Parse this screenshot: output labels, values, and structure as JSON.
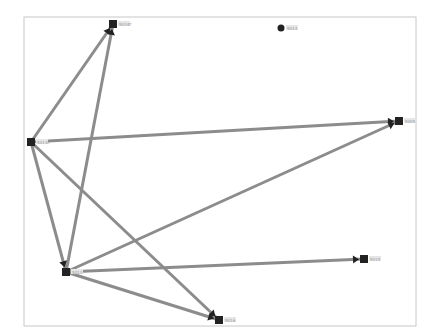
{
  "diagram": {
    "type": "network-graph",
    "frame": {
      "x": 24,
      "y": 17,
      "w": 392,
      "h": 309,
      "color": "#c8c8c8"
    },
    "colors": {
      "edge": "#8c8c8c",
      "node": "#222222",
      "label": "#9a9a9a",
      "background": "#ffffff"
    },
    "nodes": [
      {
        "id": "n1",
        "label": "5034F",
        "x": 113,
        "y": 24,
        "shape": "square"
      },
      {
        "id": "n2",
        "label": "5014",
        "x": 281,
        "y": 28,
        "shape": "circle"
      },
      {
        "id": "n3",
        "label": "5013L",
        "x": 31,
        "y": 142,
        "shape": "square"
      },
      {
        "id": "n4",
        "label": "5005",
        "x": 399,
        "y": 121,
        "shape": "square"
      },
      {
        "id": "n5",
        "label": "5013",
        "x": 66,
        "y": 272,
        "shape": "square"
      },
      {
        "id": "n6",
        "label": "5015",
        "x": 364,
        "y": 259,
        "shape": "square"
      },
      {
        "id": "n7",
        "label": "5016",
        "x": 219,
        "y": 320,
        "shape": "square"
      }
    ],
    "edges": [
      {
        "from": "n3",
        "to": "n1"
      },
      {
        "from": "n5",
        "to": "n1"
      },
      {
        "from": "n3",
        "to": "n4"
      },
      {
        "from": "n3",
        "to": "n5"
      },
      {
        "from": "n3",
        "to": "n7"
      },
      {
        "from": "n5",
        "to": "n4"
      },
      {
        "from": "n5",
        "to": "n6"
      },
      {
        "from": "n5",
        "to": "n7"
      }
    ]
  }
}
